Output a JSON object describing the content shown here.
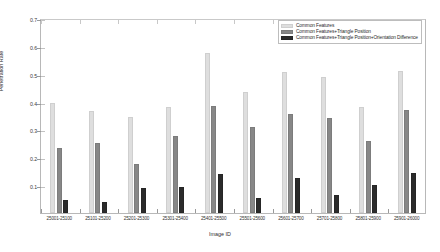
{
  "chart_data": {
    "type": "bar",
    "title": "",
    "xlabel": "Image ID",
    "ylabel": "Penetration Rate",
    "ylim": [
      0,
      0.7
    ],
    "yticks": [
      0.1,
      0.2,
      0.3,
      0.4,
      0.5,
      0.6,
      0.7
    ],
    "grid": false,
    "legend_position": "top-right",
    "categories": [
      "25001-25100",
      "25101-25200",
      "25201-25300",
      "25301-25400",
      "25401-25500",
      "25501-25600",
      "25601-25700",
      "25701-25800",
      "25801-25900",
      "25901-26000"
    ],
    "series": [
      {
        "name": "Common Features",
        "color": "#dedede",
        "values": [
          0.395,
          0.365,
          0.345,
          0.38,
          0.575,
          0.435,
          0.505,
          0.49,
          0.38,
          0.51
        ]
      },
      {
        "name": "Common Features+Triangle Position",
        "color": "#878787",
        "values": [
          0.235,
          0.25,
          0.175,
          0.275,
          0.385,
          0.31,
          0.355,
          0.34,
          0.26,
          0.37
        ]
      },
      {
        "name": "Common Features+Triangle Position+Orientation Difference",
        "color": "#2b2b2b",
        "values": [
          0.045,
          0.04,
          0.09,
          0.095,
          0.14,
          0.055,
          0.125,
          0.065,
          0.1,
          0.145
        ]
      }
    ]
  }
}
